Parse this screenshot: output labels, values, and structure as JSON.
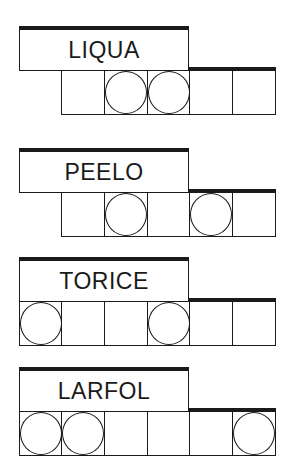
{
  "puzzles": [
    {
      "word": "LIQUA",
      "top": 26,
      "cells": [
        {
          "show": false,
          "circle": false
        },
        {
          "show": true,
          "circle": false
        },
        {
          "show": true,
          "circle": true
        },
        {
          "show": true,
          "circle": true
        },
        {
          "show": true,
          "circle": false,
          "thick": true
        },
        {
          "show": true,
          "circle": false,
          "thick": true
        }
      ]
    },
    {
      "word": "PEELO",
      "top": 148,
      "cells": [
        {
          "show": false,
          "circle": false
        },
        {
          "show": true,
          "circle": false
        },
        {
          "show": true,
          "circle": true
        },
        {
          "show": true,
          "circle": false
        },
        {
          "show": true,
          "circle": true,
          "thick": true
        },
        {
          "show": true,
          "circle": false,
          "thick": true
        }
      ]
    },
    {
      "word": "TORICE",
      "top": 257,
      "cells": [
        {
          "show": true,
          "circle": true
        },
        {
          "show": true,
          "circle": false
        },
        {
          "show": true,
          "circle": false
        },
        {
          "show": true,
          "circle": true
        },
        {
          "show": true,
          "circle": false,
          "thick": true
        },
        {
          "show": true,
          "circle": false,
          "thick": true
        }
      ]
    },
    {
      "word": "LARFOL",
      "top": 367,
      "cells": [
        {
          "show": true,
          "circle": true
        },
        {
          "show": true,
          "circle": true
        },
        {
          "show": true,
          "circle": false
        },
        {
          "show": true,
          "circle": false
        },
        {
          "show": true,
          "circle": false,
          "thick": true
        },
        {
          "show": true,
          "circle": true,
          "thick": true
        }
      ]
    }
  ]
}
